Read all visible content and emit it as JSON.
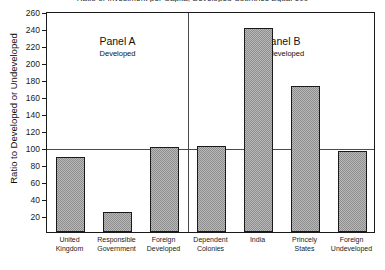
{
  "chart_data": {
    "type": "bar",
    "title": "Ratio of Investment per Capita, Developed Countries Equal 100",
    "xlabel": "",
    "ylabel": "Ratio to Developed or Undeveloped",
    "ylim": [
      0,
      260
    ],
    "yticks": [
      0,
      20,
      40,
      60,
      80,
      100,
      120,
      140,
      160,
      180,
      200,
      220,
      240,
      260
    ],
    "ytick_labels": [
      "",
      "20",
      "40",
      "60",
      "80",
      "100",
      "120",
      "140",
      "160",
      "180",
      "200",
      "220",
      "240",
      "260"
    ],
    "grid": false,
    "reference_line": 100,
    "legend": "none",
    "categories": [
      "United Kingdom",
      "Responsible Government",
      "Foreign Developed",
      "Dependent Colonies",
      "India",
      "Princely States",
      "Foreign Undeveloped"
    ],
    "category_lines": [
      [
        "United",
        "Kingdom"
      ],
      [
        "Responsible",
        "Government"
      ],
      [
        "Foreign",
        "Developed"
      ],
      [
        "Dependent",
        "Colonies"
      ],
      [
        "India",
        ""
      ],
      [
        "Princely",
        "States"
      ],
      [
        "Foreign",
        "Undeveloped"
      ]
    ],
    "values": [
      88,
      23,
      100,
      101,
      240,
      172,
      95
    ],
    "panels": [
      {
        "id": "A",
        "title": "Panel A",
        "subtitle": "Developed",
        "categories": [
          "United Kingdom",
          "Responsible Government",
          "Foreign Developed"
        ]
      },
      {
        "id": "B",
        "title": "Panel B",
        "subtitle": "Undeveloped",
        "categories": [
          "Dependent Colonies",
          "India",
          "Princely States",
          "Foreign Undeveloped"
        ]
      }
    ],
    "colors": {
      "bar_fill": "#b9b9b9",
      "bar_hatch": "#8e8e8e",
      "bar_edge": "#1a1a1a",
      "axis": "#1a1a1a",
      "reference_line": "#4a4a4a",
      "background": "#ffffff"
    }
  }
}
